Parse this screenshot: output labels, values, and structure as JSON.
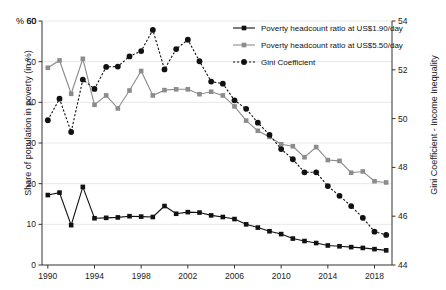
{
  "chart_data": {
    "type": "line",
    "title": "",
    "xlabel": "",
    "ylabel": "Share of population in poverty (in %)",
    "ylabel_right": "Gini Coefficient - Income Inequality",
    "y_unit_note": "% 60",
    "grid": true,
    "legend_position": "top-right",
    "ylim": [
      0,
      60
    ],
    "ylim_right": [
      44,
      54
    ],
    "xlim": [
      1989.5,
      2019.5
    ],
    "yticks": [
      0,
      10,
      20,
      30,
      40,
      50,
      60
    ],
    "yticks_right": [
      44,
      46,
      48,
      50,
      52,
      54
    ],
    "xticks": [
      1990,
      1994,
      1998,
      2002,
      2006,
      2010,
      2014,
      2018
    ],
    "x": [
      1990,
      1991,
      1992,
      1993,
      1994,
      1995,
      1996,
      1997,
      1998,
      1999,
      2000,
      2001,
      2002,
      2003,
      2004,
      2005,
      2006,
      2007,
      2008,
      2009,
      2010,
      2011,
      2012,
      2013,
      2014,
      2015,
      2016,
      2017,
      2018,
      2019
    ],
    "series": [
      {
        "name": "Poverty headcount ratio at US$1.90/day",
        "axis": "left",
        "color": "#111111",
        "marker": "square",
        "linestyle": "solid",
        "values": [
          17.2,
          17.8,
          9.8,
          19.2,
          11.5,
          11.6,
          11.7,
          12.0,
          11.9,
          11.8,
          14.5,
          12.6,
          13.0,
          12.9,
          12.2,
          11.8,
          11.3,
          10.0,
          9.2,
          8.3,
          7.6,
          6.5,
          5.9,
          5.4,
          4.8,
          4.6,
          4.4,
          4.2,
          3.9,
          3.6
        ]
      },
      {
        "name": "Poverty headcount ratio at US$5.50/day",
        "axis": "left",
        "color": "#8c8c8c",
        "marker": "square",
        "linestyle": "solid",
        "values": [
          48.5,
          50.3,
          42.1,
          50.7,
          39.4,
          41.7,
          38.5,
          42.9,
          47.7,
          41.7,
          43.0,
          43.2,
          43.2,
          42.0,
          42.6,
          41.7,
          39.0,
          35.5,
          33.0,
          31.5,
          29.7,
          29.2,
          26.5,
          29.0,
          25.8,
          25.6,
          22.7,
          23.0,
          20.6,
          20.3
        ]
      },
      {
        "name": "Gini Coefficient",
        "axis": "right",
        "color": "#111111",
        "marker": "circle",
        "linestyle": "dotted",
        "values_left_scale": [
          35.6,
          40.9,
          32.7,
          45.6,
          43.3,
          48.7,
          48.8,
          51.3,
          52.6,
          57.8,
          48.1,
          53.1,
          55.4,
          50.1,
          45.1,
          44.6,
          40.5,
          38.4,
          35.0,
          32.0,
          28.5,
          26.0,
          22.8,
          22.8,
          19.4,
          17.0,
          14.5,
          11.6,
          8.2,
          7.4
        ],
        "values": [
          51.12,
          52.18,
          50.54,
          53.12,
          52.66,
          53.74,
          53.76,
          54.26,
          54.52,
          55.56,
          53.62,
          54.62,
          55.08,
          54.02,
          53.02,
          52.92,
          52.1,
          51.68,
          51.0,
          50.4,
          49.7,
          49.2,
          48.56,
          48.56,
          47.88,
          47.4,
          46.9,
          46.32,
          45.64,
          45.48
        ]
      }
    ]
  }
}
